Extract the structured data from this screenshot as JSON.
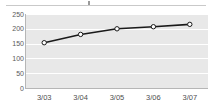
{
  "chart_data": {
    "type": "line",
    "title": "",
    "xlabel": "",
    "ylabel": "",
    "categories": [
      "3/03",
      "3/04",
      "3/05",
      "3/06",
      "3/07"
    ],
    "values": [
      153,
      181,
      200,
      207,
      215
    ],
    "series": [
      {
        "name": "series-1",
        "values": [
          153,
          181,
          200,
          207,
          215
        ],
        "line_color": "#1a1a1a",
        "marker": "open-circle",
        "marker_fill": "#ffffff",
        "marker_stroke": "#1a1a1a"
      }
    ],
    "ylim": [
      0,
      250
    ],
    "yticks": [
      0,
      50,
      100,
      150,
      200,
      250
    ],
    "ytick_labels": [
      "0",
      "50",
      "100",
      "150",
      "200",
      "250"
    ],
    "grid": true,
    "grid_color": "#ffffff",
    "plot_background": "#e8e8e8",
    "legend": "none",
    "axis_color": "#b6b6b6",
    "tick_label_color": "#4f4f4f"
  },
  "artifacts": {
    "clipped_title_text": ""
  }
}
